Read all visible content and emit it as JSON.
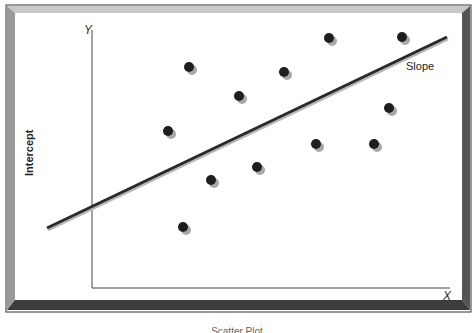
{
  "chart_data": {
    "type": "scatter",
    "title": "",
    "xlabel": "X",
    "ylabel": "Y",
    "annotations": [
      "Slope",
      "Intercept"
    ],
    "grid": false,
    "legend": null,
    "points_px": [
      {
        "x": 189,
        "y": 67
      },
      {
        "x": 168,
        "y": 131
      },
      {
        "x": 239,
        "y": 96
      },
      {
        "x": 284,
        "y": 72
      },
      {
        "x": 329,
        "y": 38
      },
      {
        "x": 402,
        "y": 37
      },
      {
        "x": 389,
        "y": 108
      },
      {
        "x": 211,
        "y": 180
      },
      {
        "x": 257,
        "y": 167
      },
      {
        "x": 316,
        "y": 144
      },
      {
        "x": 374,
        "y": 144
      },
      {
        "x": 183,
        "y": 227
      }
    ],
    "regression_line_px": {
      "x1": 47,
      "y1": 228,
      "x2": 447,
      "y2": 37
    },
    "axes_px": {
      "origin_x": 92,
      "origin_y": 288,
      "y_top": 30,
      "x_right": 450
    }
  },
  "labels": {
    "y_axis": "Y",
    "x_axis": "X",
    "slope": "Slope",
    "intercept": "Intercept",
    "caption": "Scatter Plot"
  },
  "colors": {
    "point": "#1e1e1e",
    "shadow": "#a8a8a8",
    "line": "#2a2a2a",
    "frame_top": "#c8c8c8",
    "frame_left": "#9a9a9a",
    "frame_right": "#555555",
    "frame_bottom": "#3c3c3c"
  }
}
